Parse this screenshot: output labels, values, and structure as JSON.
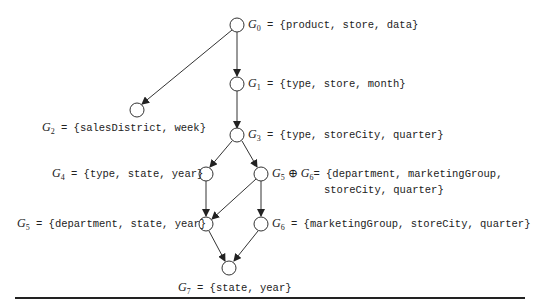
{
  "nodes": [
    {
      "id": "G0",
      "sym": "G",
      "sub": "0",
      "set": "{product, store, data}"
    },
    {
      "id": "G1",
      "sym": "G",
      "sub": "1",
      "set": "{type, store, month}"
    },
    {
      "id": "G2",
      "sym": "G",
      "sub": "2",
      "set": "{salesDistrict, week}"
    },
    {
      "id": "G3",
      "sym": "G",
      "sub": "3",
      "set": "{type, storeCity, quarter}"
    },
    {
      "id": "G4",
      "sym": "G",
      "sub": "4",
      "set": "{type, state, year}"
    },
    {
      "id": "G56",
      "sym": "G",
      "sub": "5",
      "op": "⊕",
      "sym2": "G",
      "sub2": "6",
      "set1": "{department, marketingGroup,",
      "set2": "storeCity, quarter}"
    },
    {
      "id": "G5",
      "sym": "G",
      "sub": "5",
      "set": "{department, state, year}"
    },
    {
      "id": "G6",
      "sym": "G",
      "sub": "6",
      "set": "{marketingGroup, storeCity, quarter}"
    },
    {
      "id": "G7",
      "sym": "G",
      "sub": "7",
      "set": "{state, year}"
    }
  ],
  "eq": "="
}
